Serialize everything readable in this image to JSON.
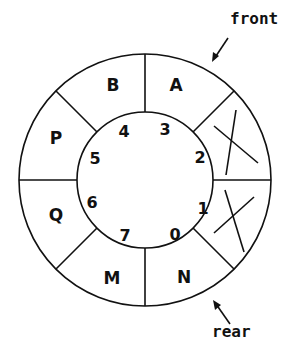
{
  "diagram": {
    "slots": [
      {
        "index": "0",
        "content": "N"
      },
      {
        "index": "1",
        "content": "",
        "crossed": true
      },
      {
        "index": "2",
        "content": "",
        "crossed": true
      },
      {
        "index": "3",
        "content": "A"
      },
      {
        "index": "4",
        "content": "B"
      },
      {
        "index": "5",
        "content": "P"
      },
      {
        "index": "6",
        "content": "Q"
      },
      {
        "index": "7",
        "content": "M"
      }
    ],
    "pointers": {
      "front": "front",
      "rear": "rear"
    }
  }
}
